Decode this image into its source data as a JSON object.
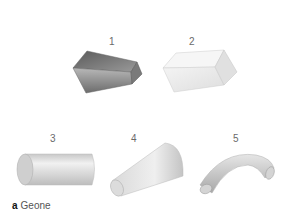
{
  "figure": {
    "caption": {
      "letter": "a",
      "text": "Geone"
    },
    "geons": [
      {
        "number": "1",
        "shape": "tapered-prism",
        "shading": "dark-gray"
      },
      {
        "number": "2",
        "shape": "rectangular-block",
        "shading": "light-gray"
      },
      {
        "number": "3",
        "shape": "cylinder",
        "shading": "light-gray"
      },
      {
        "number": "4",
        "shape": "truncated-cone",
        "shading": "light-gray"
      },
      {
        "number": "5",
        "shape": "curved-tube",
        "shading": "light-gray"
      }
    ]
  }
}
